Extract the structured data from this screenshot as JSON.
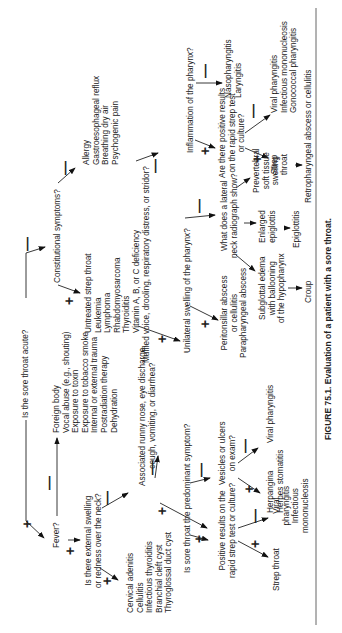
{
  "figure": {
    "caption": "FIGURE 75.1.   Evaluation of a patient with a sore throat.",
    "root_question": "Is the sore throat acute?"
  },
  "nodes": {
    "fever": "Fever?",
    "noninfectious_causes": [
      "Foreign body",
      "Vocal abuse (e.g., shouting)",
      "Exposure to toxin",
      "Exposure to tobacco smoke",
      "Internal or external trauma",
      "Postradiation therapy",
      "Dehydration"
    ],
    "external_swelling_q": [
      "Is there external swelling",
      "or redness over the neck?"
    ],
    "neck_causes": [
      "Cervical adenitis",
      "Cellulitis",
      "Infectious thyroiditis",
      "Branchial cleft cyst",
      "Thyroglossal duct cyst"
    ],
    "associated_symptoms_q": [
      "Associated runny nose, eye discharge,",
      "cough, vomiting, or diarrhea?"
    ],
    "predominant_q": "Is sore throat the predominant symptom?",
    "rapid_strep_q1": [
      "Positive results on the",
      "rapid strep test or culture?"
    ],
    "strep_throat_1": "Strep throat",
    "viral_1": [
      "Viral",
      "pharyngitis",
      "Infectious",
      "mononucleosis"
    ],
    "vesicles_q": [
      "Vesicles or ulcers",
      "on exam?"
    ],
    "herpangina": [
      "Herpangina",
      "Herpes stomatitis"
    ],
    "viral_pharyngitis_2": "Viral pharyngitis",
    "constitutional_q": "Constitutional symptoms?",
    "chronic_causes": [
      "Untreated strep throat",
      "Leukemia",
      "Lymphoma",
      "Rhabdomyosarcoma",
      "Thyroiditis",
      "Vitamin A, B, or C deficiency"
    ],
    "other_chronic": [
      "Allergy",
      "Gastroesophageal reflux",
      "Breathing dry air",
      "Psychogenic pain"
    ],
    "muffled_q": "Muffled voice, drooling, respiratory distress, or stridor?",
    "unilateral_q": "Unilateral swelling of the pharynx?",
    "abscess": [
      "Peritonsillar abscess",
      "or cellulitis",
      "Parapharyngeal abscess"
    ],
    "radiograph_q": [
      "What does a lateral",
      "neck radiograph show?"
    ],
    "subglottal": [
      "Subglottal edema",
      "with ballooning",
      "of the hypopharynx"
    ],
    "croup": "Croup",
    "enlarged_epiglottis": [
      "Enlarged",
      "epiglottis"
    ],
    "epiglottitis": "Epiglottitis",
    "prevertebral": [
      "Prevertebral",
      "soft tissue",
      "swelling"
    ],
    "retropharyngeal": "Retropharyngeal abscess or cellulitis",
    "inflammation_q": "Inflammation of the pharynx?",
    "rapid_strep_q2": [
      "Are there positive results",
      "on the rapid strep test",
      "or culture?"
    ],
    "strep_throat_2": [
      "Strep",
      "throat"
    ],
    "viral_list_2": [
      "Viral pharyngitis",
      "Infectious mononucleosis",
      "Gonococcal pharyngitis"
    ],
    "naso": [
      "Nasopharyngitis",
      "Laryngitis"
    ]
  },
  "signs": {
    "plus": "+",
    "minus": "—"
  }
}
